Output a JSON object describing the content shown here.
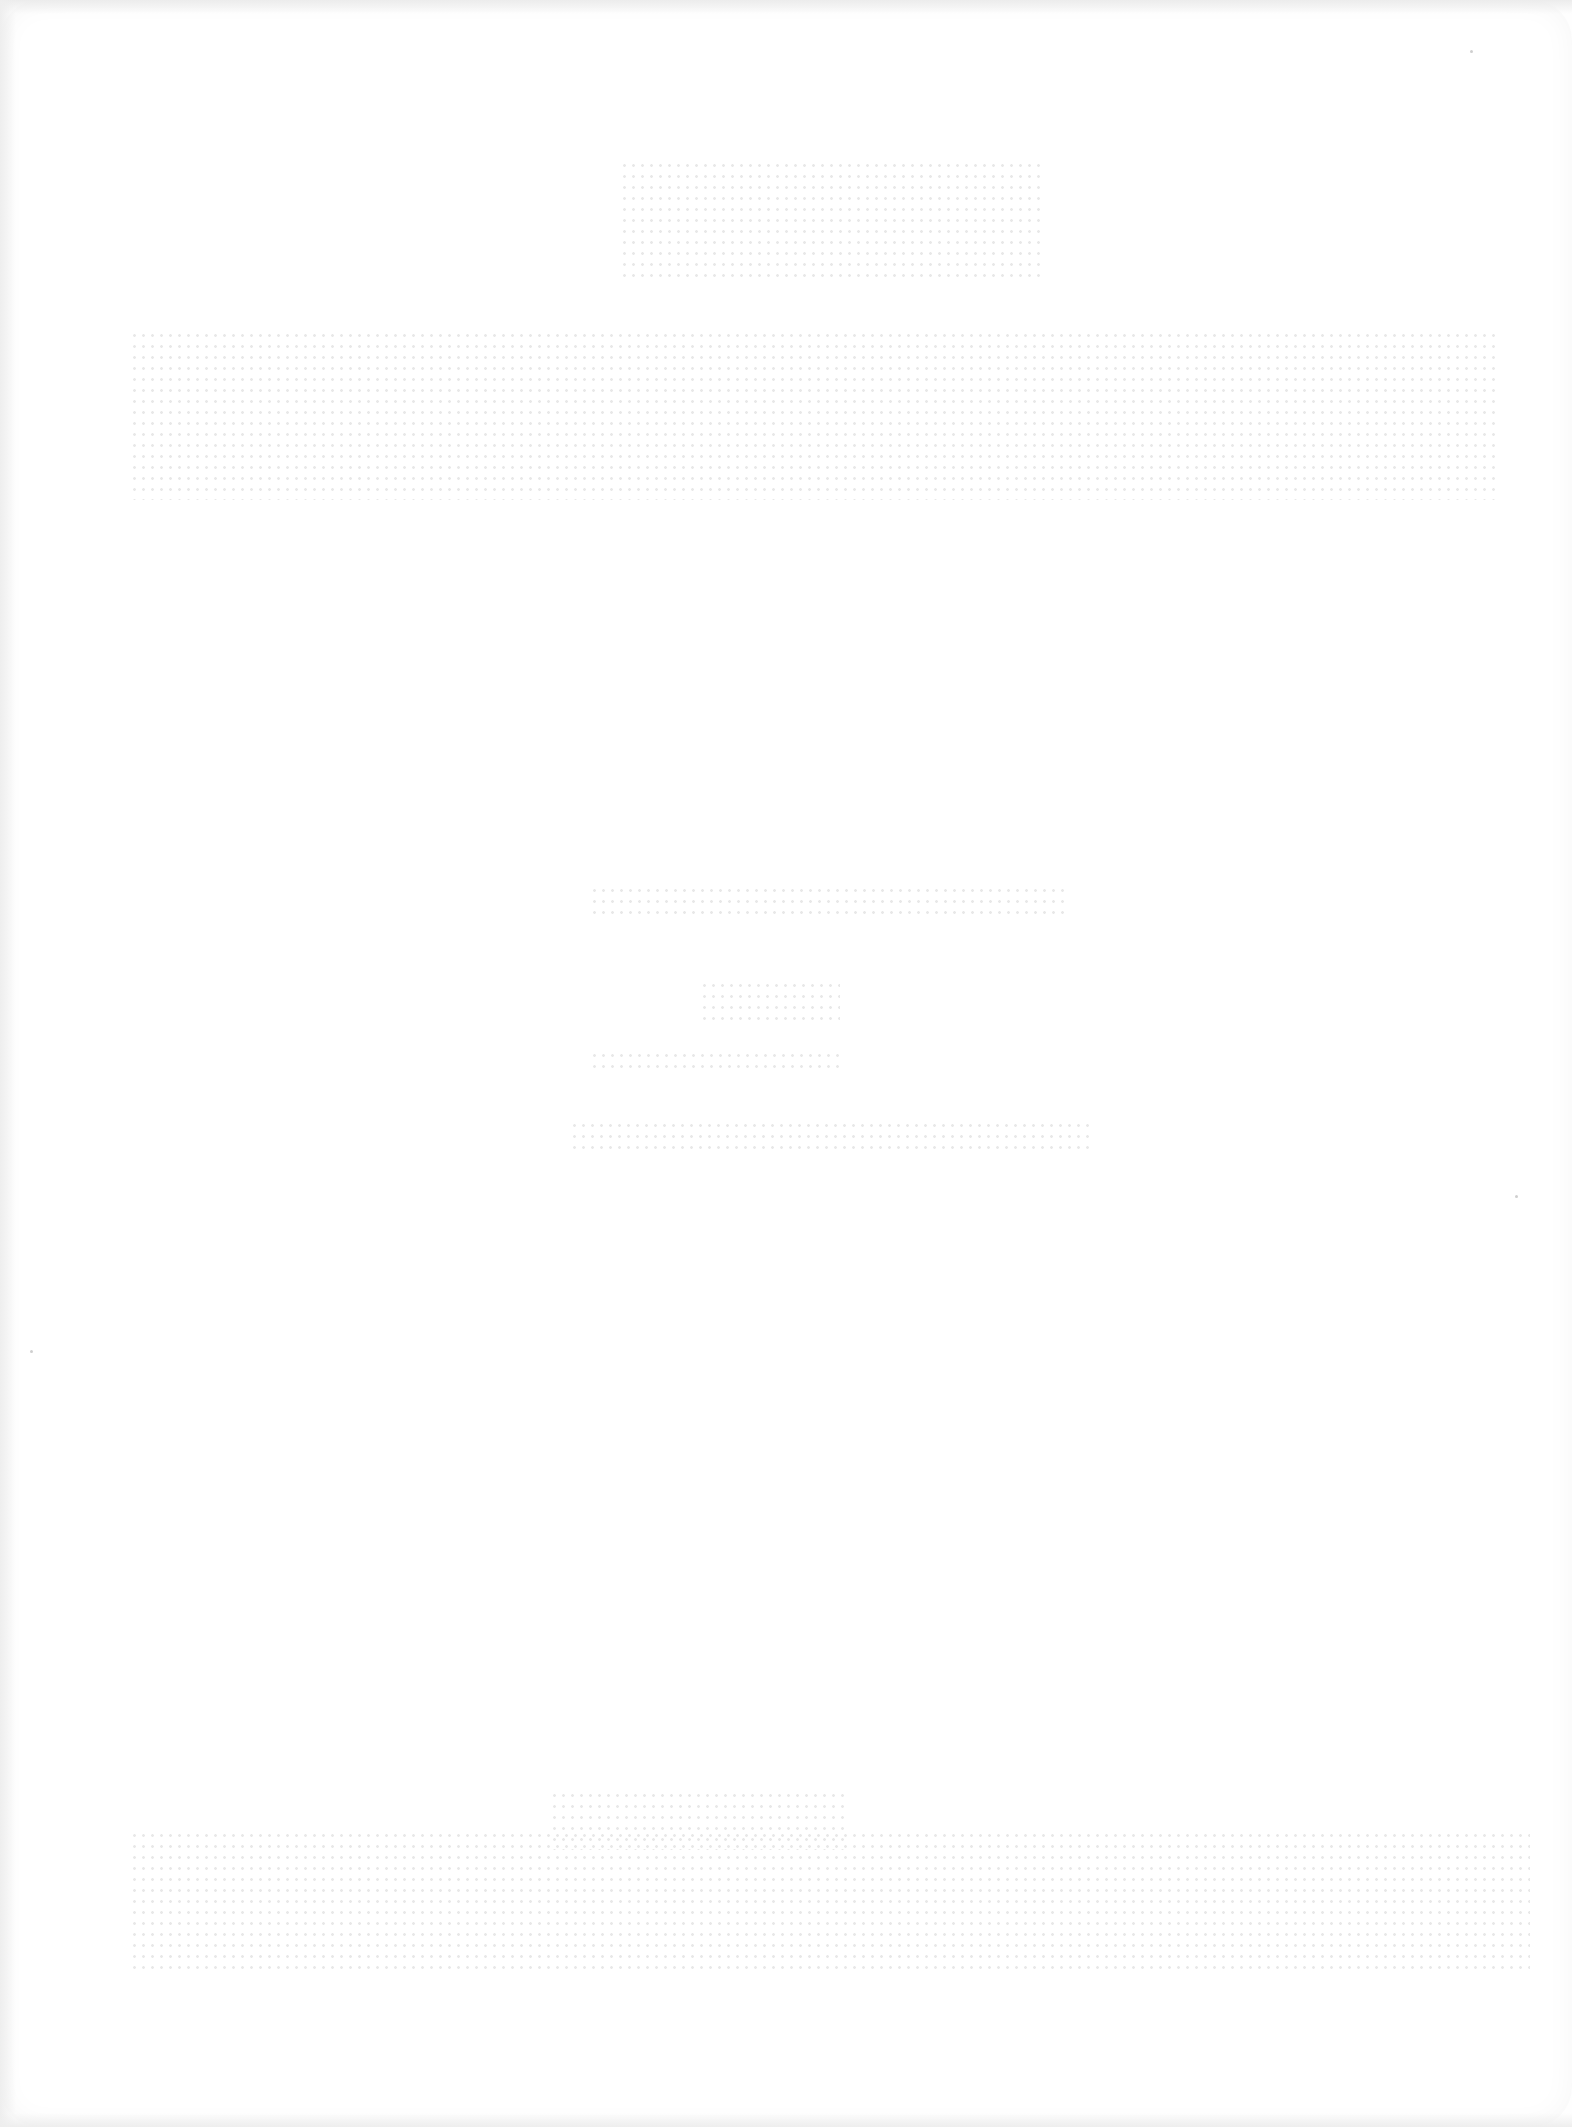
{
  "document": {
    "type": "scanned-title-page",
    "legibility": "illegible",
    "lines": [
      {
        "id": "top-heading",
        "text": ""
      },
      {
        "id": "main-title",
        "text": ""
      },
      {
        "id": "subtitle-line-1",
        "text": ""
      },
      {
        "id": "subtitle-line-2",
        "text": ""
      },
      {
        "id": "subtitle-line-3",
        "text": ""
      },
      {
        "id": "subtitle-line-4",
        "text": ""
      },
      {
        "id": "footer-small",
        "text": ""
      },
      {
        "id": "footer-title",
        "text": ""
      }
    ]
  },
  "colors": {
    "paper": "#ffffff",
    "ink_faded": "#d8d8d8"
  }
}
